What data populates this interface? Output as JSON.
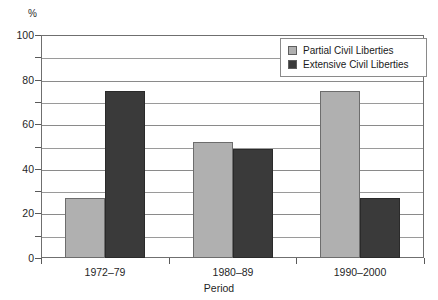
{
  "chart_data": {
    "type": "bar",
    "title": "",
    "xlabel": "Period",
    "ylabel": "%",
    "ylim": [
      0,
      100
    ],
    "grid": true,
    "legend_position": "top-right",
    "categories": [
      "1972–79",
      "1980–89",
      "1990–2000"
    ],
    "series": [
      {
        "name": "Partial Civil Liberties",
        "color": "#b0b0b0",
        "values": [
          27,
          52,
          75
        ]
      },
      {
        "name": "Extensive Civil Liberties",
        "color": "#3a3a3a",
        "values": [
          75,
          49,
          27
        ]
      }
    ],
    "y_ticks": [
      {
        "value": 100,
        "label": "100"
      },
      {
        "value": 90,
        "label": ""
      },
      {
        "value": 80,
        "label": "80"
      },
      {
        "value": 70,
        "label": ""
      },
      {
        "value": 60,
        "label": "60"
      },
      {
        "value": 50,
        "label": ""
      },
      {
        "value": 40,
        "label": "40"
      },
      {
        "value": 30,
        "label": ""
      },
      {
        "value": 20,
        "label": "20"
      },
      {
        "value": 10,
        "label": ""
      },
      {
        "value": 0,
        "label": "0"
      }
    ]
  },
  "axes": {
    "y_unit": "%",
    "y_labels": [
      "100",
      "80",
      "60",
      "40",
      "20",
      "0"
    ],
    "x_title": "Period",
    "x_labels": [
      "1972–79",
      "1980–89",
      "1990–2000"
    ]
  },
  "legend": {
    "items": [
      {
        "label": "Partial Civil Liberties",
        "color": "#b0b0b0"
      },
      {
        "label": "Extensive Civil Liberties",
        "color": "#3a3a3a"
      }
    ]
  },
  "colors": {
    "partial": "#b0b0b0",
    "extensive": "#3a3a3a",
    "axis": "#6f6f6f",
    "grid": "#8a8a8a",
    "background": "#ffffff"
  }
}
